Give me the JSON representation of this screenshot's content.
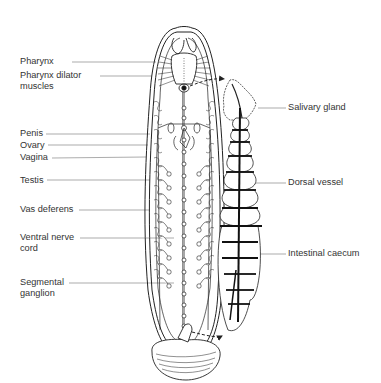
{
  "figure": {
    "line_color": "#222222",
    "label_color": "#333333",
    "leader_color": "#777777"
  },
  "labels_left": [
    {
      "id": "pharynx",
      "lines": [
        "Pharynx"
      ]
    },
    {
      "id": "pharynx-dilator-muscles",
      "lines": [
        "Pharynx dilator",
        "muscles"
      ]
    },
    {
      "id": "penis",
      "lines": [
        "Penis"
      ]
    },
    {
      "id": "ovary",
      "lines": [
        "Ovary"
      ]
    },
    {
      "id": "vagina",
      "lines": [
        "Vagina"
      ]
    },
    {
      "id": "testis",
      "lines": [
        "Testis"
      ]
    },
    {
      "id": "vas-deferens",
      "lines": [
        "Vas deferens"
      ]
    },
    {
      "id": "ventral-nerve-cord",
      "lines": [
        "Ventral nerve",
        "cord"
      ]
    },
    {
      "id": "segmental-ganglion",
      "lines": [
        "Segmental",
        "ganglion"
      ]
    }
  ],
  "labels_right": [
    {
      "id": "salivary-gland",
      "lines": [
        "Salivary gland"
      ]
    },
    {
      "id": "dorsal-vessel",
      "lines": [
        "Dorsal vessel"
      ]
    },
    {
      "id": "intestinal-caecum",
      "lines": [
        "Intestinal caecum"
      ]
    }
  ]
}
